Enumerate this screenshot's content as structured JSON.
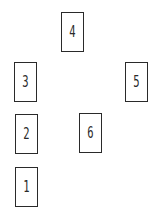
{
  "diagram": {
    "type": "card-spread-layout",
    "cards": [
      {
        "label": "1",
        "x": 15,
        "y": 167
      },
      {
        "label": "2",
        "x": 15,
        "y": 114
      },
      {
        "label": "3",
        "x": 14,
        "y": 62
      },
      {
        "label": "4",
        "x": 61,
        "y": 12
      },
      {
        "label": "5",
        "x": 125,
        "y": 62
      },
      {
        "label": "6",
        "x": 79,
        "y": 113
      }
    ]
  }
}
